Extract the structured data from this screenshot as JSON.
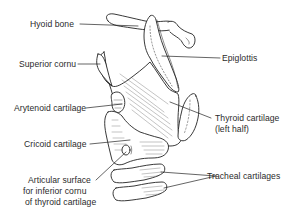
{
  "diagram": {
    "colors": {
      "ink": "#222222",
      "background": "#ffffff",
      "text": "#2b2b2b"
    },
    "labels": {
      "hyoid_bone": "Hyoid bone",
      "superior_cornu": "Superior cornu",
      "epiglottis": "Epiglottis",
      "arytenoid_cartilage": "Arytenoid cartilage",
      "thyroid_cartilage_line1": "Thyroid cartilage",
      "thyroid_cartilage_line2": "(left half)",
      "cricoid_cartilage": "Cricoid cartilage",
      "articular_surface_line1": "Articular surface",
      "articular_surface_line2": "for inferior cornu",
      "articular_surface_line3": "of thyroid cartilage",
      "tracheal_cartilages": "Tracheal cartilages"
    }
  }
}
